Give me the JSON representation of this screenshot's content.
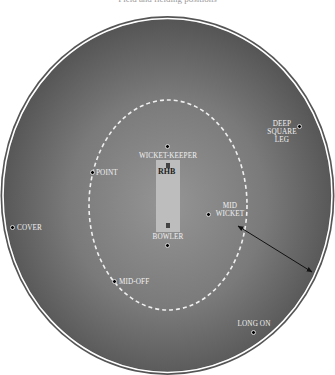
{
  "title": "Field and fielding positions",
  "colors": {
    "field_center": "#8c8c8c",
    "field_edge": "#505050",
    "boundary_inner": "#ffffff",
    "boundary_outer": "#555555",
    "circle_dash": "#f0f0f0",
    "pitch": "#bdbdbd",
    "label": "#f2f2f2"
  },
  "pitch": {
    "batsman_label": "RHB"
  },
  "positions": [
    {
      "name": "WICKET-KEEPER",
      "label": "WICKET-KEEPER"
    },
    {
      "name": "BOWLER",
      "label": "BOWLER"
    },
    {
      "name": "POINT",
      "label": "POINT"
    },
    {
      "name": "COVER",
      "label": "COVER"
    },
    {
      "name": "MID-OFF",
      "label": "MID-OFF"
    },
    {
      "name": "MID WICKET",
      "label_line1": "MID",
      "label_line2": "WICKET"
    },
    {
      "name": "DEEP SQUARE LEG",
      "label_line1": "DEEP",
      "label_line2": "SQUARE",
      "label_line3": "LEG"
    },
    {
      "name": "LONG ON",
      "label": "LONG ON"
    }
  ]
}
